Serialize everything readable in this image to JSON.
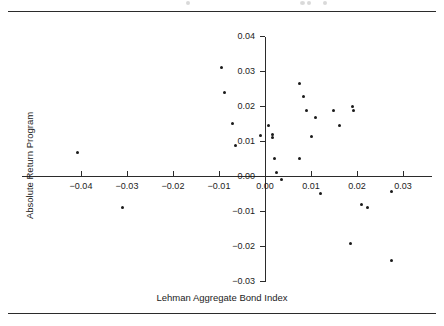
{
  "figure": {
    "page_rule_top": true,
    "page_rule_bottom": true
  },
  "chart_data": {
    "type": "scatter",
    "title": "",
    "xlabel": "Lehman Aggregate Bond Index",
    "ylabel": "Absolute Return Program",
    "xlim": [
      -0.0465,
      0.0363
    ],
    "ylim": [
      -0.0315,
      0.04
    ],
    "grid": false,
    "legend": null,
    "xticks": [
      -0.04,
      -0.03,
      -0.02,
      -0.01,
      0.0,
      0.01,
      0.02,
      0.03
    ],
    "xticklabels": [
      "-0.04",
      "-0.03",
      "-0.02",
      "-0.01",
      "0.00",
      "0.01",
      "0.02",
      "0.03"
    ],
    "yticks": [
      0.04,
      0.03,
      0.02,
      0.01,
      0.0,
      -0.01,
      -0.02,
      -0.03
    ],
    "yticklabels": [
      "0.04",
      "0.03",
      "0.02",
      "0.01",
      "0.00",
      "-0.01",
      "-0.02",
      "-0.03"
    ],
    "series": [
      {
        "name": "Absolute Return Program vs Lehman Aggregate Bond Index",
        "marker": "dot",
        "color": "#1a1a1a",
        "points": [
          {
            "x": -0.0407,
            "y": 0.0066
          },
          {
            "x": -0.0309,
            "y": -0.0089
          },
          {
            "x": -0.0094,
            "y": 0.0309
          },
          {
            "x": -0.0087,
            "y": 0.024
          },
          {
            "x": -0.007,
            "y": 0.0149
          },
          {
            "x": -0.0065,
            "y": 0.0086
          },
          {
            "x": -0.0009,
            "y": 0.0117
          },
          {
            "x": 0.0007,
            "y": 0.0143
          },
          {
            "x": 0.0017,
            "y": 0.0111
          },
          {
            "x": 0.0017,
            "y": 0.012
          },
          {
            "x": 0.002,
            "y": 0.0049
          },
          {
            "x": 0.0024,
            "y": 0.0009
          },
          {
            "x": 0.0035,
            "y": -0.0009
          },
          {
            "x": 0.0074,
            "y": 0.0049
          },
          {
            "x": 0.0074,
            "y": 0.0265
          },
          {
            "x": 0.0083,
            "y": 0.0226
          },
          {
            "x": 0.0091,
            "y": 0.0186
          },
          {
            "x": 0.0102,
            "y": 0.0114
          },
          {
            "x": 0.011,
            "y": 0.0166
          },
          {
            "x": 0.012,
            "y": -0.0051
          },
          {
            "x": 0.0148,
            "y": 0.0186
          },
          {
            "x": 0.0163,
            "y": 0.0143
          },
          {
            "x": 0.0185,
            "y": -0.0194
          },
          {
            "x": 0.0191,
            "y": 0.02
          },
          {
            "x": 0.0193,
            "y": 0.0186
          },
          {
            "x": 0.021,
            "y": -0.008
          },
          {
            "x": 0.0223,
            "y": -0.0091
          },
          {
            "x": 0.0274,
            "y": -0.024
          },
          {
            "x": 0.0274,
            "y": -0.0043
          }
        ]
      }
    ]
  }
}
